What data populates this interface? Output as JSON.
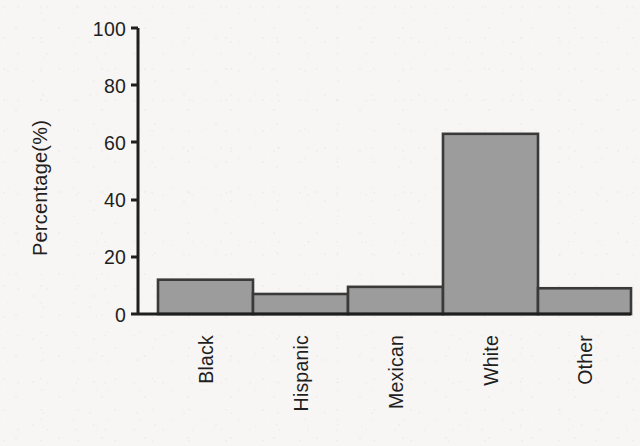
{
  "chart_data": {
    "type": "bar",
    "title": "",
    "subtitle": "",
    "xlabel": "",
    "ylabel": "Percentage(%)",
    "categories": [
      "Black",
      "Hispanic",
      "Mexican",
      "White",
      "Other"
    ],
    "values": [
      12,
      7,
      9.5,
      63,
      9
    ],
    "ylim": [
      0,
      100
    ],
    "yticks": [
      "0",
      "20",
      "40",
      "60",
      "80",
      "100"
    ],
    "ytick_values": [
      0,
      20,
      40,
      60,
      80,
      100
    ],
    "grid": false,
    "legend": false,
    "legend_position": "none",
    "bar_fill_color": "#9c9c9c",
    "bar_border_color": "#3a3a3a",
    "axis_color": "#1f1f1f",
    "background_color": "#f7f6f4",
    "bars_touching": true,
    "xtick_label_rotation": -90
  },
  "figure": {
    "width": 640,
    "height": 446
  }
}
